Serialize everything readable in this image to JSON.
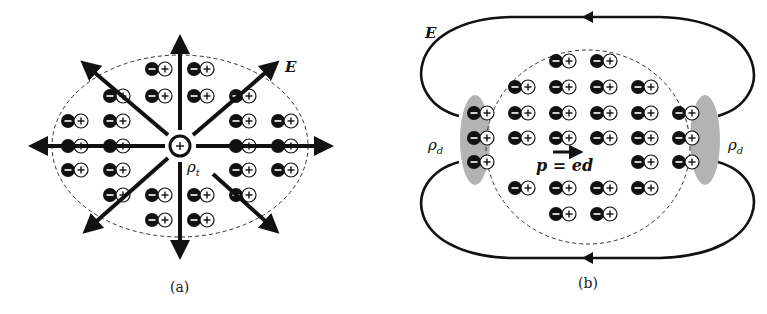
{
  "figure": {
    "panels": [
      {
        "id": "a",
        "caption": "(a)",
        "field_label": "E",
        "charge_label": "ρ",
        "charge_subscript": "t",
        "center_charge": "+",
        "description": "Radial electric field from a free charge ρt polarizing surrounding dipoles"
      },
      {
        "id": "b",
        "caption": "(b)",
        "field_label": "E",
        "left_charge_label": "ρ",
        "left_charge_subscript": "d",
        "right_charge_label": "ρ",
        "right_charge_subscript": "d",
        "dipole_label": "p = ed",
        "description": "Uniformly polarized body with bound surface charges ρd and external field loops"
      }
    ],
    "dipole_symbols": {
      "negative": "−",
      "positive": "+"
    },
    "colors": {
      "ink": "#111111",
      "shade": "#9a9a9a",
      "background": "#ffffff"
    }
  }
}
